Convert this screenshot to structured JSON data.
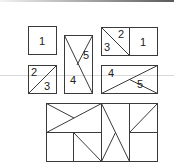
{
  "figure": {
    "title": "",
    "pieces": {
      "square_1": {
        "label": "1"
      },
      "square_2_3": {
        "labels": [
          "2",
          "3"
        ]
      },
      "tall_4_5": {
        "labels": [
          "4",
          "5"
        ]
      },
      "rect_3_2_1": {
        "labels": [
          "3",
          "2",
          "1"
        ]
      },
      "rect_4_5": {
        "labels": [
          "4",
          "5"
        ]
      }
    },
    "composite": {
      "description": "assembled rectangle from pieces"
    }
  },
  "colors": {
    "stroke": "#3a3a3a",
    "guide_line": "#d8d8d8",
    "background": "#ffffff"
  }
}
